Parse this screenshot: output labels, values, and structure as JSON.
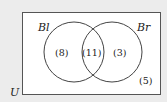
{
  "diagram": {
    "type": "venn",
    "universe_label": "U",
    "sets": [
      {
        "label": "Bl"
      },
      {
        "label": "Br"
      }
    ],
    "regions": {
      "only_bl": "(8)",
      "both": "(11)",
      "only_br": "(3)",
      "outside": "(5)"
    },
    "colors": {
      "background": "#ececec",
      "universe_fill": "#ffffff",
      "stroke": "#444444"
    }
  }
}
